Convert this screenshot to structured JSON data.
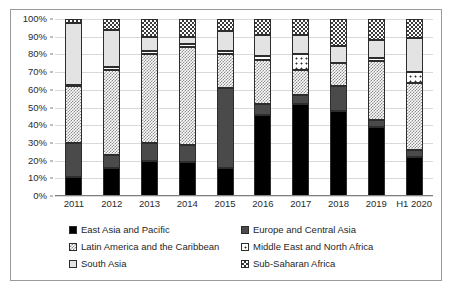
{
  "chart_data": {
    "type": "bar",
    "title": "",
    "subtitle": "",
    "xlabel": "",
    "ylabel": "",
    "stacked": true,
    "stack_mode": "percent",
    "grid": true,
    "legend_position": "bottom",
    "ylim": [
      0,
      100
    ],
    "ytick_labels": [
      "0%",
      "10%",
      "20%",
      "30%",
      "40%",
      "50%",
      "60%",
      "70%",
      "80%",
      "90%",
      "100%"
    ],
    "ytick_values": [
      0,
      10,
      20,
      30,
      40,
      50,
      60,
      70,
      80,
      90,
      100
    ],
    "categories": [
      "2011",
      "2012",
      "2013",
      "2014",
      "2015",
      "2016",
      "2017",
      "2018",
      "2019",
      "H1 2020"
    ],
    "series": [
      {
        "name": "East Asia and Pacific",
        "key": "eap",
        "pattern": "solid-black",
        "color": "#000000",
        "values": [
          11,
          16,
          20,
          19,
          16,
          46,
          52,
          48,
          39,
          22
        ]
      },
      {
        "name": "Europe and Central Asia",
        "key": "eca",
        "pattern": "solid-dark-grey",
        "color": "#4a4a4a",
        "values": [
          19,
          7,
          10,
          10,
          45,
          6,
          5,
          14,
          4,
          4
        ]
      },
      {
        "name": "Latin America and the Caribbean",
        "key": "lac",
        "pattern": "light-checker",
        "color": "#8d8d8d",
        "values": [
          32,
          48,
          50,
          55,
          19,
          25,
          14,
          13,
          33,
          38
        ]
      },
      {
        "name": "Middle East and North Africa",
        "key": "mena",
        "pattern": "white-dotted",
        "color": "#ffffff",
        "values": [
          1,
          2,
          2,
          2,
          2,
          2,
          9,
          0,
          2,
          6
        ]
      },
      {
        "name": "South Asia",
        "key": "sa",
        "pattern": "open-light",
        "color": "#e3e3e3",
        "values": [
          35,
          21,
          8,
          4,
          11,
          12,
          11,
          10,
          10,
          19
        ]
      },
      {
        "name": "Sub-Saharan Africa",
        "key": "ssa",
        "pattern": "dense-dark-checker",
        "color": "#3a3a3a",
        "values": [
          2,
          6,
          10,
          10,
          7,
          9,
          9,
          15,
          12,
          11
        ]
      }
    ]
  }
}
